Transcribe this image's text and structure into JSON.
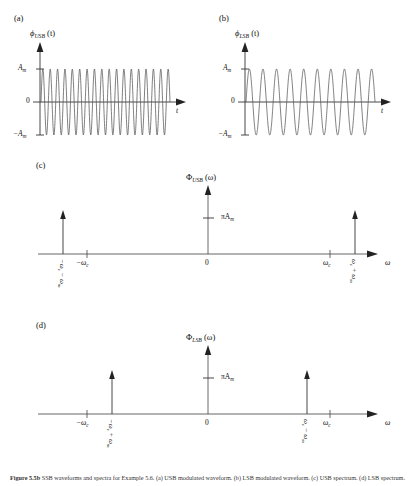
{
  "figure": {
    "caption_bold": "Figure 5.5b",
    "caption_text": "SSB waveforms and spectra for Example 5.6. (a) USB modulated waveform. (b) LSB modulated waveform. (c) USB spectrum. (d) LSB spectrum."
  },
  "panels": [
    {
      "tag": "(a)",
      "y_axis_label": "ϕ",
      "y_axis_sub": "USB",
      "y_axis_arg": "(t)",
      "x_axis_label": "t",
      "y_ticks": [
        "A",
        "0",
        "−A"
      ],
      "y_tick_top": "A",
      "y_tick_top_sub": "m",
      "y_tick_mid": "0",
      "y_tick_bot": "−A",
      "y_tick_bot_sub": "m"
    },
    {
      "tag": "(b)",
      "y_axis_label": "ϕ",
      "y_axis_sub": "LSB",
      "y_axis_arg": "(t)",
      "x_axis_label": "t",
      "y_tick_top": "A",
      "y_tick_top_sub": "m",
      "y_tick_mid": "0",
      "y_tick_bot": "−A",
      "y_tick_bot_sub": "m"
    },
    {
      "tag": "(c)",
      "y_axis_label": "Φ",
      "y_axis_sub": "USB",
      "y_axis_arg": "(ω)",
      "x_axis_label": "ω",
      "amp_label": "πA",
      "amp_label_sub": "m",
      "origin_label": "0",
      "tick_left": "−ω",
      "tick_left_sub": "c",
      "tick_right": "ω",
      "tick_right_sub": "c",
      "spike_left_label": "−ω",
      "spike_left_sub": "c",
      "spike_left_op": "− ω",
      "spike_left_op_sub": "m",
      "spike_right_label": "ω",
      "spike_right_sub": "c",
      "spike_right_op": "+ ω",
      "spike_right_op_sub": "m"
    },
    {
      "tag": "(d)",
      "y_axis_label": "Φ",
      "y_axis_sub": "LSB",
      "y_axis_arg": "(ω)",
      "x_axis_label": "ω",
      "amp_label": "πA",
      "amp_label_sub": "m",
      "origin_label": "0",
      "tick_left": "−ω",
      "tick_left_sub": "c",
      "tick_right": "ω",
      "tick_right_sub": "c",
      "spike_left_label": "−ω",
      "spike_left_sub": "c",
      "spike_left_op": "+ ω",
      "spike_left_op_sub": "m",
      "spike_right_label": "ω",
      "spike_right_sub": "c",
      "spike_right_op": "− ω",
      "spike_right_op_sub": "m"
    }
  ],
  "chart_data": [
    {
      "type": "line",
      "id": "usb-waveform",
      "title": "ϕ_USB(t)",
      "xlabel": "t",
      "ylabel": "ϕ_USB(t)",
      "ytick_labels": [
        "A_m",
        "0",
        "−A_m"
      ],
      "ytick_values": [
        1,
        0,
        -1
      ],
      "ylim": [
        -1.15,
        1.15
      ],
      "xlim": [
        0,
        1
      ],
      "cycles": 17.5,
      "amplitude": 1,
      "grid": false,
      "legend": "none",
      "description": "Upper sideband modulated sinusoid, constant envelope A_m, frequency (wc+wm)"
    },
    {
      "type": "line",
      "id": "lsb-waveform",
      "title": "ϕ_LSB(t)",
      "xlabel": "t",
      "ylabel": "ϕ_LSB(t)",
      "ytick_labels": [
        "A_m",
        "0",
        "−A_m"
      ],
      "ytick_values": [
        1,
        0,
        -1
      ],
      "ylim": [
        -1.15,
        1.15
      ],
      "xlim": [
        0,
        1
      ],
      "cycles": 9.5,
      "amplitude": 1,
      "grid": false,
      "legend": "none",
      "description": "Lower sideband modulated sinusoid, constant envelope A_m, frequency (wc-wm)"
    },
    {
      "type": "bar",
      "id": "usb-spectrum",
      "title": "Φ_USB(ω)",
      "xlabel": "ω",
      "ylabel": "Φ_USB(ω)",
      "categories": [
        "−ωc − ωm",
        "ωc + ωm"
      ],
      "values": [
        3.1416,
        3.1416
      ],
      "value_label": "πA_m",
      "x_positions": [
        -1.45,
        1.45
      ],
      "axis_ticks": [
        -1.2,
        0,
        1.2
      ],
      "axis_tick_labels": [
        "−ωc",
        "0",
        "ωc"
      ],
      "grid": false,
      "legend": "none",
      "description": "Two impulses of weight πA_m at ±(ωc+ωm), outside the carrier ticks"
    },
    {
      "type": "bar",
      "id": "lsb-spectrum",
      "title": "Φ_LSB(ω)",
      "xlabel": "ω",
      "ylabel": "Φ_LSB(ω)",
      "categories": [
        "−ωc + ωm",
        "ωc − ωm"
      ],
      "values": [
        3.1416,
        3.1416
      ],
      "value_label": "πA_m",
      "x_positions": [
        -0.95,
        0.95
      ],
      "axis_ticks": [
        -1.2,
        0,
        1.2
      ],
      "axis_tick_labels": [
        "−ωc",
        "0",
        "ωc"
      ],
      "grid": false,
      "legend": "none",
      "description": "Two impulses of weight πA_m at ±(ωc−ωm), inside the carrier ticks"
    }
  ]
}
